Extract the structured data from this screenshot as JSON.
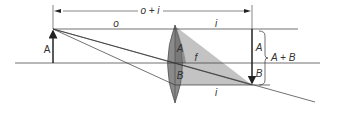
{
  "diagram": {
    "labels": {
      "total_distance": "o + i",
      "object_distance": "o",
      "image_distance_top": "i",
      "image_distance_bottom": "i",
      "object": "A",
      "lens_upper": "A",
      "lens_lower": "B",
      "focal": "f",
      "image_upper": "A",
      "image_lower": "B",
      "image_total": "A + B"
    },
    "colors": {
      "lens_fill": "#8a8a8a",
      "cone_fill": "#b8b8b8",
      "line": "#333333"
    }
  }
}
